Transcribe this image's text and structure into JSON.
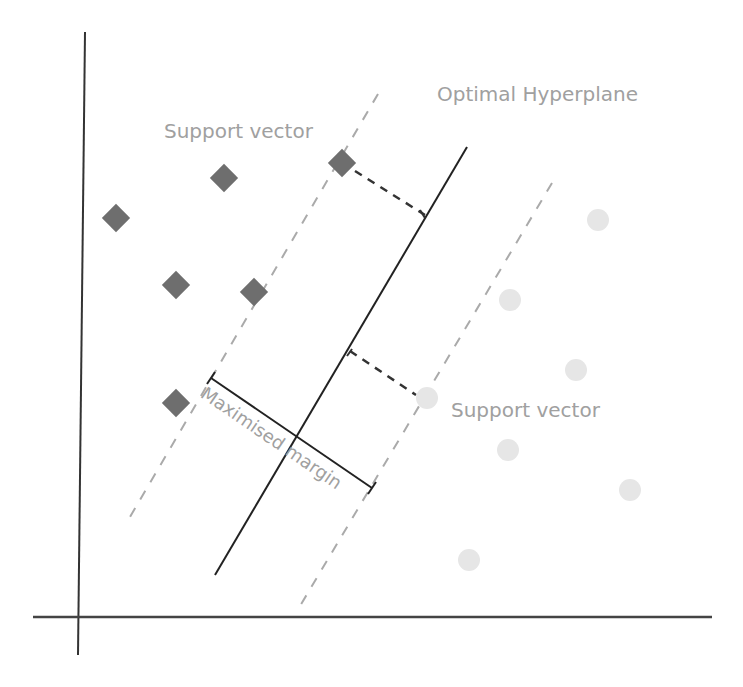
{
  "diagram": {
    "labels": {
      "support_vector_top": "Support vector",
      "optimal_hyperplane": "Optimal Hyperplane",
      "support_vector_bottom": "Support vector",
      "maximised_margin": "Maximised margin"
    },
    "colors": {
      "axis": "#333333",
      "hyperplane": "#222222",
      "margin_dashed": "#aaaaaa",
      "perpendicular_dashed": "#333333",
      "class_a_diamond": "#6e6e6e",
      "class_b_circle": "#e4e4e4",
      "label_text": "#a0a0a0"
    },
    "class_a_diamonds": [
      {
        "x": 116,
        "y": 218
      },
      {
        "x": 224,
        "y": 178
      },
      {
        "x": 342,
        "y": 163
      },
      {
        "x": 176,
        "y": 285
      },
      {
        "x": 254,
        "y": 292
      },
      {
        "x": 176,
        "y": 403
      }
    ],
    "class_b_circles": [
      {
        "x": 598,
        "y": 220
      },
      {
        "x": 510,
        "y": 300
      },
      {
        "x": 576,
        "y": 370
      },
      {
        "x": 427,
        "y": 398
      },
      {
        "x": 508,
        "y": 450
      },
      {
        "x": 630,
        "y": 490
      },
      {
        "x": 469,
        "y": 560
      }
    ]
  }
}
